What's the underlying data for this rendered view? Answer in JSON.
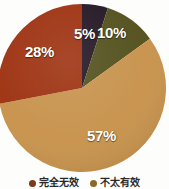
{
  "chart_data": {
    "type": "pie",
    "title": "",
    "subtitle": "",
    "xlabel": "",
    "ylabel": "",
    "grid": false,
    "legend_position": "bottom",
    "start_angle_deg": 0,
    "direction": "clockwise",
    "categories": [
      "完全无效",
      "不太有效",
      "",
      ""
    ],
    "values": [
      5,
      10,
      57,
      28
    ],
    "slices": [
      {
        "label": "5%",
        "value": 5,
        "color": "#241825",
        "name": "完全无效"
      },
      {
        "label": "10%",
        "value": 10,
        "color": "#54511e",
        "name": "不太有效"
      },
      {
        "label": "57%",
        "value": 57,
        "color": "#c8934d",
        "name": ""
      },
      {
        "label": "28%",
        "value": 28,
        "color": "#9e3312",
        "name": ""
      }
    ]
  },
  "labels": {
    "slice_5": "5%",
    "slice_10": "10%",
    "slice_57": "57%",
    "slice_28": "28%"
  },
  "legend": {
    "items": [
      {
        "label": "完全无效",
        "color": "#7a3a1c"
      },
      {
        "label": "不太有效",
        "color": "#8a6a2a"
      }
    ]
  },
  "colors": {
    "background": "#fdfdfc",
    "label_text": "#ffffff",
    "legend_text": "#2a2a2a",
    "slice_dark_navy": "#241825",
    "slice_olive": "#54511e",
    "slice_tan": "#c8934d",
    "slice_brick": "#9e3312"
  }
}
